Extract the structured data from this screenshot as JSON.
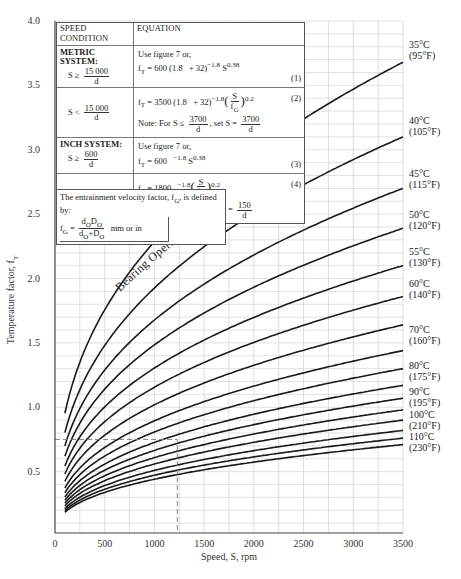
{
  "chart_data": {
    "type": "line",
    "title": "",
    "xlabel": "Speed, S, rpm",
    "ylabel": "Temperature factor, f_T",
    "xlim": [
      0,
      3500
    ],
    "ylim": [
      0,
      4.0
    ],
    "x_ticks": [
      "0",
      "500",
      "1000",
      "1500",
      "2000",
      "2500",
      "3000",
      "3500"
    ],
    "y_ticks": [
      "0.5",
      "1.0",
      "1.5",
      "2.0",
      "2.5",
      "3.0",
      "3.5",
      "4.0"
    ],
    "grid": true,
    "curve_family_label": "Bearing Operating Temperature",
    "x": [
      100,
      250,
      500,
      750,
      1000,
      1250,
      1500,
      2000,
      2500,
      3000,
      3500
    ],
    "series": [
      {
        "name": "35°C (95°F)",
        "end_value": 3.68
      },
      {
        "name": "40°C (105°F)",
        "end_value": 3.1
      },
      {
        "name": "45°C (115°F)",
        "end_value": 2.7
      },
      {
        "name": "50°C (120°F)",
        "end_value": 2.39
      },
      {
        "name": "55°C (130°F)",
        "end_value": 2.1
      },
      {
        "name": "60°C (140°F)",
        "end_value": 1.86
      },
      {
        "name": "65°C",
        "end_value": 1.64
      },
      {
        "name": "70°C (160°F)",
        "end_value": 1.44
      },
      {
        "name": "75°C",
        "end_value": 1.3
      },
      {
        "name": "80°C (175°F)",
        "end_value": 1.17
      },
      {
        "name": "85°C",
        "end_value": 1.07
      },
      {
        "name": "90°C (195°F)",
        "end_value": 0.98
      },
      {
        "name": "95°C",
        "end_value": 0.9
      },
      {
        "name": "100°C (210°F)",
        "end_value": 0.82
      },
      {
        "name": "105°C",
        "end_value": 0.76
      },
      {
        "name": "110°C (230°F)",
        "end_value": 0.71
      }
    ],
    "curve_exponent": 0.38,
    "right_labels": [
      {
        "c": "35°C",
        "f": "(95°F)",
        "y": 48
      },
      {
        "c": "40°C",
        "f": "(105°F)",
        "y": 124
      },
      {
        "c": "45°C",
        "f": "(115°F)",
        "y": 177
      },
      {
        "c": "50°C",
        "f": "(120°F)",
        "y": 218
      },
      {
        "c": "55°C",
        "f": "(130°F)",
        "y": 255
      },
      {
        "c": "60°C",
        "f": "(140°F)",
        "y": 287
      },
      {
        "c": "70°C",
        "f": "(160°F)",
        "y": 333
      },
      {
        "c": "80°C",
        "f": "(175°F)",
        "y": 369
      },
      {
        "c": "90°C",
        "f": "(195°F)",
        "y": 395
      },
      {
        "c": "100°C",
        "f": "(210°F)",
        "y": 418
      },
      {
        "c": "110°C",
        "f": "(230°F)",
        "y": 440
      }
    ],
    "annotations": [
      {
        "type": "dashed-reference",
        "x": 1230,
        "y": 0.75
      }
    ]
  },
  "table": {
    "header": {
      "condition": "SPEED CONDITION",
      "equation": "EQUATION"
    },
    "metric": {
      "title": "METRIC SYSTEM:",
      "cond1_lhs": "S  ≥",
      "cond1_num": "15 000",
      "cond1_den": "d",
      "eq1_intro": "Use figure 7 or,",
      "eq1": "f<sub>T</sub> = 600 (1.8 &nbsp;&nbsp;+ 32)<sup>−1.8</sup> S<sup>0.38</sup>",
      "eq1_no": "(1)",
      "cond2_lhs": "S  <",
      "cond2_num": "15 000",
      "cond2_den": "d",
      "eq2_no": "(2)",
      "note2_prefix": "Note:  For  S ≤",
      "note2_num": "3700",
      "note2_den": "d",
      "note2_mid": ", set  S  =",
      "note2_num2": "3700",
      "note2_den2": "d"
    },
    "inch": {
      "title": "INCH SYSTEM:",
      "cond1_lhs": "S  ≥",
      "cond1_num": "600",
      "cond1_den": "d",
      "eq3_intro": "Use figure 7 or,",
      "eq3_no": "(3)",
      "cond2_lhs": "S  <",
      "cond2_num": "600",
      "cond2_den": "d",
      "eq4_no": "(4)",
      "note4_prefix": "Note:  For  S ≤",
      "note4_num": "150",
      "note4_den": "d",
      "note4_mid": ", set  S  =",
      "note4_num2": "150",
      "note4_den2": "d"
    }
  },
  "definition": {
    "text": "The entrainment velocity factor, f",
    "text_sub": "G",
    "text_tail": ", is defined by:",
    "units": "mm or in"
  }
}
